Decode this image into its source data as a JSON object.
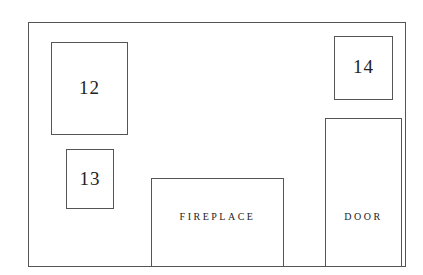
{
  "diagram": {
    "type": "floor-plan-wall",
    "colors": {
      "stroke": "#555555",
      "text": "#222222",
      "background": "#ffffff"
    },
    "elements": [
      {
        "id": "12",
        "label": "12"
      },
      {
        "id": "13",
        "label": "13"
      },
      {
        "id": "14",
        "label": "14"
      },
      {
        "id": "fireplace",
        "label": "FIREPLACE"
      },
      {
        "id": "door",
        "label": "DOOR"
      }
    ]
  }
}
